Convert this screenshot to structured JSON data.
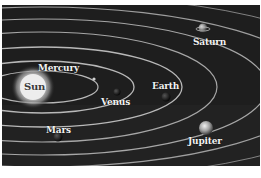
{
  "diagram": {
    "type": "solar-system-illustration",
    "colors": {
      "background": "#1c1c1c",
      "orbit": "#d8d8d8",
      "sun": "#e6e6e6",
      "label": "#f2f2f2",
      "page": "#ffffff"
    },
    "bodies": [
      {
        "name": "Sun",
        "label": "Sun"
      },
      {
        "name": "Mercury",
        "label": "Mercury"
      },
      {
        "name": "Venus",
        "label": "Venus"
      },
      {
        "name": "Earth",
        "label": "Earth"
      },
      {
        "name": "Mars",
        "label": "Mars"
      },
      {
        "name": "Jupiter",
        "label": "Jupiter"
      },
      {
        "name": "Saturn",
        "label": "Saturn"
      }
    ]
  }
}
